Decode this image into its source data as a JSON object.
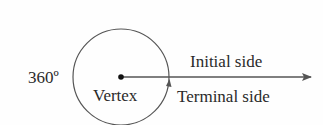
{
  "diagram": {
    "angle_label": "360º",
    "vertex_label": "Vertex",
    "initial_side_label": "Initial side",
    "terminal_side_label": "Terminal side",
    "colors": {
      "stroke": "#555555",
      "text": "#2a2a2a",
      "background": "#fefefe"
    }
  }
}
